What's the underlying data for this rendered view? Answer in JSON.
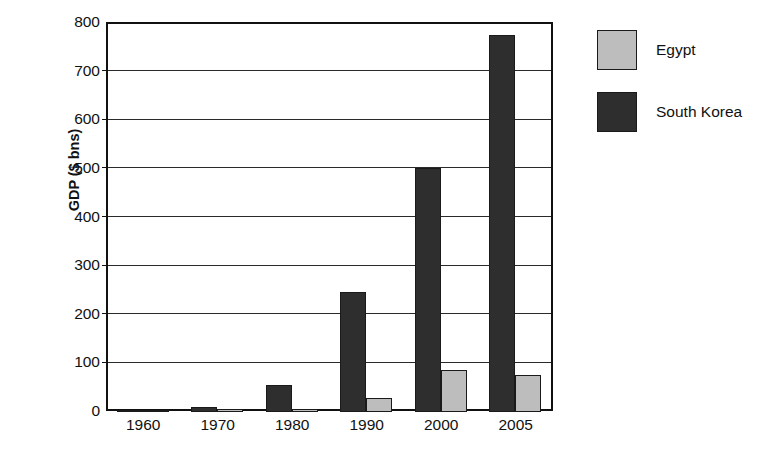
{
  "chart_data": {
    "type": "bar",
    "title": "",
    "xlabel": "",
    "ylabel": "GDP ($ bns)",
    "categories": [
      "1960",
      "1970",
      "1980",
      "1990",
      "2000",
      "2005"
    ],
    "series": [
      {
        "name": "South Korea",
        "color": "#2e2e2e",
        "values": [
          4,
          9,
          54,
          245,
          500,
          775
        ]
      },
      {
        "name": "Egypt",
        "color": "#bdbdbd",
        "values": [
          3,
          6,
          5,
          27,
          85,
          75
        ]
      }
    ],
    "ylim": [
      0,
      800
    ],
    "y_ticks": [
      "800",
      "700",
      "600",
      "500",
      "400",
      "300",
      "200",
      "100",
      "0"
    ],
    "y_tick_values": [
      800,
      700,
      600,
      500,
      400,
      300,
      200,
      100,
      0
    ],
    "grid": true,
    "legend_position": "right",
    "legend_entries": [
      {
        "label": "Egypt",
        "color": "#bdbdbd"
      },
      {
        "label": "South Korea",
        "color": "#2e2e2e"
      }
    ]
  }
}
